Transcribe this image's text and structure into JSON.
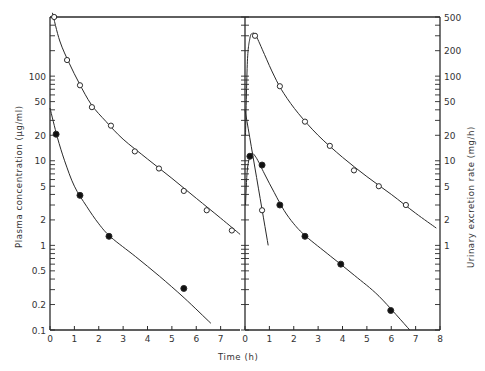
{
  "chart_data": [
    {
      "type": "scatter",
      "panel": "left",
      "title": "",
      "xlabel": "Time (h)",
      "ylabel": "Plasma concentration (µg/ml)",
      "yscale": "log",
      "xlim": [
        0,
        7.8
      ],
      "ylim": [
        0.1,
        500
      ],
      "xticks": [
        0,
        1,
        2,
        3,
        4,
        5,
        6,
        7
      ],
      "yticks": [
        0.1,
        0.2,
        0.5,
        1,
        2,
        5,
        10,
        20,
        50,
        100
      ],
      "ytick_labels": [
        "0.1",
        "0.2",
        "0.5",
        "1",
        "2",
        "5",
        "10",
        "20",
        "50",
        "100"
      ],
      "series": [
        {
          "name": "open-circles",
          "marker": "open-circle",
          "x": [
            0.17,
            0.7,
            1.23,
            1.72,
            2.5,
            3.48,
            4.47,
            5.49,
            6.43,
            7.46
          ],
          "y": [
            500,
            155,
            78,
            43,
            26,
            12.9,
            8.1,
            4.4,
            2.6,
            1.5
          ],
          "fit_curve": {
            "x": [
              0.1,
              0.4,
              0.8,
              1.2,
              1.7,
              2.3,
              3,
              4,
              5,
              6,
              7,
              7.8
            ],
            "y": [
              560,
              260,
              140,
              82,
              46,
              29,
              18,
              10.5,
              6.2,
              3.6,
              2.1,
              1.35
            ]
          }
        },
        {
          "name": "filled-circles",
          "marker": "filled-circle",
          "x": [
            0.25,
            1.23,
            2.42,
            5.49
          ],
          "y": [
            20.6,
            3.9,
            1.28,
            0.31
          ],
          "fit_curve": {
            "x": [
              0,
              0.3,
              0.6,
              1,
              1.5,
              2,
              2.5,
              3.5,
              4.5,
              5.5,
              6.6
            ],
            "y": [
              42,
              19,
              10,
              5,
              2.9,
              1.8,
              1.25,
              0.74,
              0.43,
              0.24,
              0.12
            ]
          }
        }
      ]
    },
    {
      "type": "scatter",
      "panel": "right",
      "title": "",
      "xlabel": "Time (h)",
      "ylabel": "Urinary excretion rate (mg/h)",
      "yscale": "log",
      "xlim": [
        0,
        8
      ],
      "ylim": [
        0.1,
        500
      ],
      "xticks": [
        0,
        1,
        2,
        3,
        4,
        5,
        6,
        7,
        8
      ],
      "yticks": [
        1,
        2,
        5,
        10,
        20,
        50,
        100,
        200,
        500
      ],
      "ytick_labels": [
        "1",
        "2",
        "5",
        "10",
        "20",
        "50",
        "100",
        "200",
        "500"
      ],
      "series": [
        {
          "name": "open-circles",
          "marker": "open-circle",
          "x": [
            0.41,
            1.43,
            2.46,
            3.48,
            4.47,
            5.49,
            6.6
          ],
          "y": [
            300,
            76,
            29,
            15,
            7.7,
            5.0,
            3.0
          ],
          "fit_curve": {
            "x": [
              0.02,
              0.1,
              0.2,
              0.3,
              0.45,
              0.8,
              1.2,
              1.6,
              2.2,
              3,
              4,
              5,
              6,
              7,
              7.85
            ],
            "y": [
              20,
              150,
              280,
              320,
              300,
              180,
              100,
              62,
              36,
              20,
              11,
              6.5,
              4,
              2.4,
              1.6
            ]
          }
        },
        {
          "name": "filled-circles",
          "marker": "filled-circle",
          "x": [
            0.2,
            0.7,
            1.43,
            2.46,
            3.93,
            5.98
          ],
          "y": [
            11.3,
            8.9,
            3.0,
            1.28,
            0.6,
            0.17
          ],
          "fit_curve": {
            "x": [
              0.02,
              0.1,
              0.25,
              0.45,
              0.8,
              1.2,
              1.6,
              2,
              2.5,
              3.5,
              4.5,
              5.5,
              6.76
            ],
            "y": [
              3,
              8,
              12,
              11,
              7,
              4.2,
              2.6,
              1.8,
              1.28,
              0.75,
              0.44,
              0.25,
              0.1
            ]
          }
        },
        {
          "name": "open-small",
          "marker": "open-circle",
          "x": [
            0.7
          ],
          "y": [
            2.6
          ],
          "fit_curve": {
            "x": [
              0.0,
              0.95
            ],
            "y": [
              40,
              1.0
            ]
          }
        }
      ]
    }
  ],
  "labels": {
    "xlabel": "Time (h)",
    "left_ylabel": "Plasma concentration (µg/ml)",
    "right_ylabel": "Urinary excretion rate (mg/h)"
  }
}
